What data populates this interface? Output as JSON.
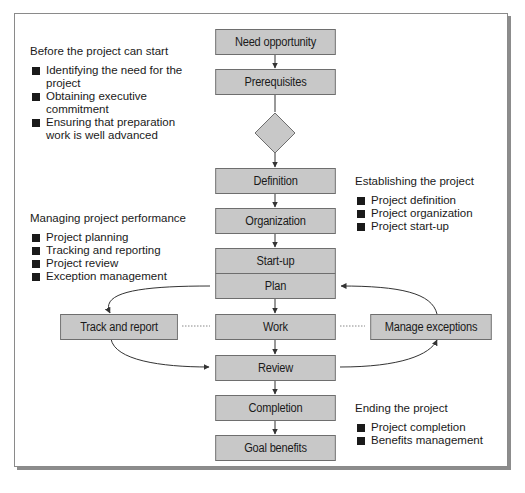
{
  "diagram": {
    "colors": {
      "box_fill": "#c8c8c8",
      "box_border": "#6e6e6e",
      "line": "#333333",
      "frame_border": "#8a8a8a",
      "frame_shadow": "#8c8c8c"
    },
    "flow_nodes": [
      {
        "id": "need-opportunity",
        "label": "Need opportunity"
      },
      {
        "id": "prerequisites",
        "label": "Prerequisites"
      },
      {
        "id": "decision",
        "label": "",
        "shape": "diamond"
      },
      {
        "id": "definition",
        "label": "Definition"
      },
      {
        "id": "organization",
        "label": "Organization"
      },
      {
        "id": "start-up",
        "label": "Start-up"
      },
      {
        "id": "plan",
        "label": "Plan"
      },
      {
        "id": "work",
        "label": "Work"
      },
      {
        "id": "review",
        "label": "Review"
      },
      {
        "id": "completion",
        "label": "Completion"
      },
      {
        "id": "goal-benefits",
        "label": "Goal benefits"
      }
    ],
    "side_nodes": [
      {
        "id": "track-and-report",
        "label": "Track and report"
      },
      {
        "id": "manage-exceptions",
        "label": "Manage exceptions"
      }
    ],
    "sections": [
      {
        "id": "before-start",
        "heading": "Before the project can start",
        "items": [
          "Identifying the need for the project",
          "Obtaining executive commitment",
          "Ensuring that preparation work is well advanced"
        ]
      },
      {
        "id": "establishing",
        "heading": "Establishing the project",
        "items": [
          "Project definition",
          "Project organization",
          "Project start-up"
        ]
      },
      {
        "id": "managing",
        "heading": "Managing project performance",
        "items": [
          "Project planning",
          "Tracking and reporting",
          "Project review",
          "Exception management"
        ]
      },
      {
        "id": "ending",
        "heading": "Ending the project",
        "items": [
          "Project completion",
          "Benefits management"
        ]
      }
    ]
  }
}
